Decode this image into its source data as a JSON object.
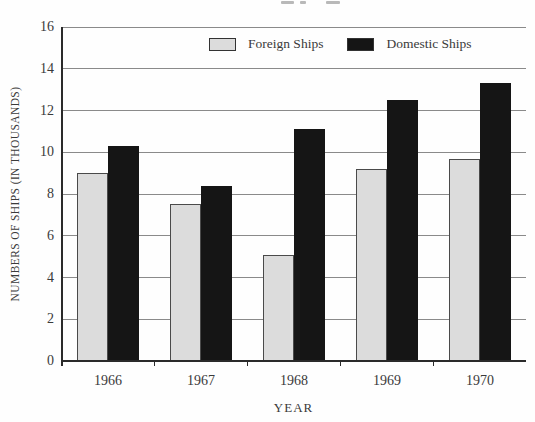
{
  "chart_data": {
    "type": "bar",
    "title": "",
    "categories": [
      "1966",
      "1967",
      "1968",
      "1969",
      "1970"
    ],
    "series": [
      {
        "name": "Foreign Ships",
        "color": "#dcdcdc",
        "values": [
          9.0,
          7.5,
          5.1,
          9.2,
          9.7
        ]
      },
      {
        "name": "Domestic Ships",
        "color": "#151515",
        "values": [
          10.3,
          8.4,
          11.1,
          12.5,
          13.3
        ]
      }
    ],
    "xlabel": "YEAR",
    "ylabel": "NUMBERS OF SHIPS (IN THOUSANDS)",
    "ylim": [
      0,
      16
    ],
    "yticks": [
      0,
      2,
      4,
      6,
      8,
      10,
      12,
      14,
      16
    ],
    "grid": true,
    "legend_position": "top-center"
  },
  "colors": {
    "gridline": "#8a8a8a",
    "axis": "#2a2a2a",
    "text": "#3a3a3a",
    "background": "#fefefe"
  }
}
